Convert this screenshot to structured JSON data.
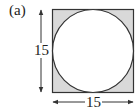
{
  "figure": {
    "label": "(a)",
    "shape": "circle inscribed in square, corners shaded",
    "side_vertical": "15",
    "side_horizontal": "15",
    "colors": {
      "shade": "#d9d9d9",
      "stroke": "#333333",
      "circle_fill": "#ffffff"
    }
  }
}
